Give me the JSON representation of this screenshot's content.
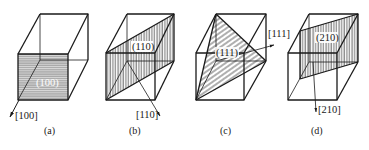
{
  "figure": {
    "panels": [
      {
        "id": "a",
        "caption": "(a)",
        "plane_label": "(100)",
        "direction_label": "[100]",
        "hatch": "horizontal",
        "plane_fill": "#9a9a9a"
      },
      {
        "id": "b",
        "caption": "(b)",
        "plane_label": "(110)",
        "direction_label": "[110]",
        "hatch": "vertical"
      },
      {
        "id": "c",
        "caption": "(c)",
        "plane_label": "(111)",
        "direction_label": "[111]",
        "hatch": "diagonal"
      },
      {
        "id": "d",
        "caption": "(d)",
        "plane_label": "(210)",
        "direction_label": "[210]",
        "hatch": "vertical"
      }
    ],
    "colors": {
      "line": "#1a1a1a",
      "shade": "#9a9a9a",
      "background": "#ffffff"
    }
  }
}
